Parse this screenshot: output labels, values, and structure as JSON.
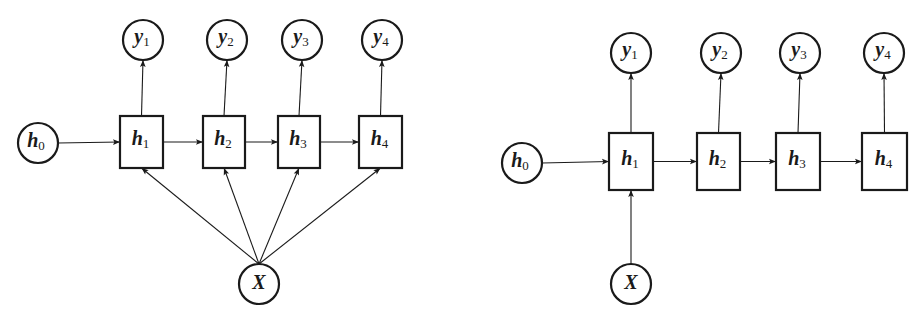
{
  "diagrams": [
    {
      "name": "rnn-vector-to-sequence-input-each-step",
      "initial": {
        "var": "h",
        "sub": "0",
        "cx": 38,
        "cy": 143
      },
      "input": {
        "var": "X",
        "sub": "",
        "cx": 259,
        "cy": 284
      },
      "hidden": [
        {
          "var": "h",
          "sub": "1",
          "x": 120,
          "y": 116,
          "w": 43,
          "h": 52
        },
        {
          "var": "h",
          "sub": "2",
          "x": 203,
          "y": 116,
          "w": 42,
          "h": 52
        },
        {
          "var": "h",
          "sub": "3",
          "x": 278,
          "y": 116,
          "w": 42,
          "h": 52
        },
        {
          "var": "h",
          "sub": "4",
          "x": 359,
          "y": 116,
          "w": 43,
          "h": 52
        }
      ],
      "outputs": [
        {
          "var": "y",
          "sub": "1",
          "cx": 143,
          "cy": 40
        },
        {
          "var": "y",
          "sub": "2",
          "cx": 227,
          "cy": 40
        },
        {
          "var": "y",
          "sub": "3",
          "cx": 302,
          "cy": 40
        },
        {
          "var": "y",
          "sub": "4",
          "cx": 382,
          "cy": 40
        }
      ],
      "input_to_all_steps": true
    },
    {
      "name": "rnn-vector-to-sequence-input-first-step",
      "initial": {
        "var": "h",
        "sub": "0",
        "cx": 522,
        "cy": 163
      },
      "input": {
        "var": "X",
        "sub": "",
        "cx": 631,
        "cy": 284
      },
      "hidden": [
        {
          "var": "h",
          "sub": "1",
          "x": 609,
          "y": 133,
          "w": 44,
          "h": 57
        },
        {
          "var": "h",
          "sub": "2",
          "x": 697,
          "y": 133,
          "w": 43,
          "h": 57
        },
        {
          "var": "h",
          "sub": "3",
          "x": 776,
          "y": 133,
          "w": 44,
          "h": 57
        },
        {
          "var": "h",
          "sub": "4",
          "x": 862,
          "y": 133,
          "w": 45,
          "h": 57
        }
      ],
      "outputs": [
        {
          "var": "y",
          "sub": "1",
          "cx": 631,
          "cy": 53
        },
        {
          "var": "y",
          "sub": "2",
          "cx": 721,
          "cy": 53
        },
        {
          "var": "y",
          "sub": "3",
          "cx": 800,
          "cy": 53
        },
        {
          "var": "y",
          "sub": "4",
          "cx": 884,
          "cy": 53
        }
      ],
      "input_to_all_steps": false
    }
  ],
  "style": {
    "stroke": "#1a1a1a",
    "background": "#ffffff",
    "radius": 20
  }
}
